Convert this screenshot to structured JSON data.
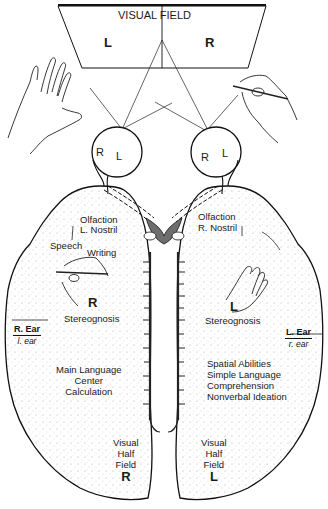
{
  "visual_field": {
    "title": "VISUAL FIELD",
    "left": "L",
    "right": "R"
  },
  "eyes": {
    "left_eye": {
      "r": "R",
      "l": "L"
    },
    "right_eye": {
      "r": "R",
      "l": "L"
    }
  },
  "left_hemisphere": {
    "olfaction_line1": "Olfaction",
    "olfaction_line2": "L. Nostril",
    "speech": "Speech",
    "writing": "Writing",
    "hand_letter": "R",
    "stereognosis": "Stereognosis",
    "ear_major": "R. Ear",
    "ear_minor": "l. ear",
    "functions": [
      "Main Language",
      "Center",
      "Calculation"
    ],
    "visual_half_field": [
      "Visual",
      "Half",
      "Field"
    ],
    "visual_letter": "R"
  },
  "right_hemisphere": {
    "olfaction_line1": "Olfaction",
    "olfaction_line2": "R. Nostril",
    "hand_letter": "L",
    "stereognosis": "Stereognosis",
    "ear_major": "L. Ear",
    "ear_minor": "r. ear",
    "functions": [
      "Spatial Abilities",
      "Simple Language",
      "Comprehension",
      "Nonverbal Ideation"
    ],
    "visual_half_field": [
      "Visual",
      "Half",
      "Field"
    ],
    "visual_letter": "L"
  },
  "colors": {
    "ink": "#1a1a1a",
    "stipple": "#9a9a9a",
    "commissure": "#6e6e6e",
    "background": "#ffffff"
  }
}
